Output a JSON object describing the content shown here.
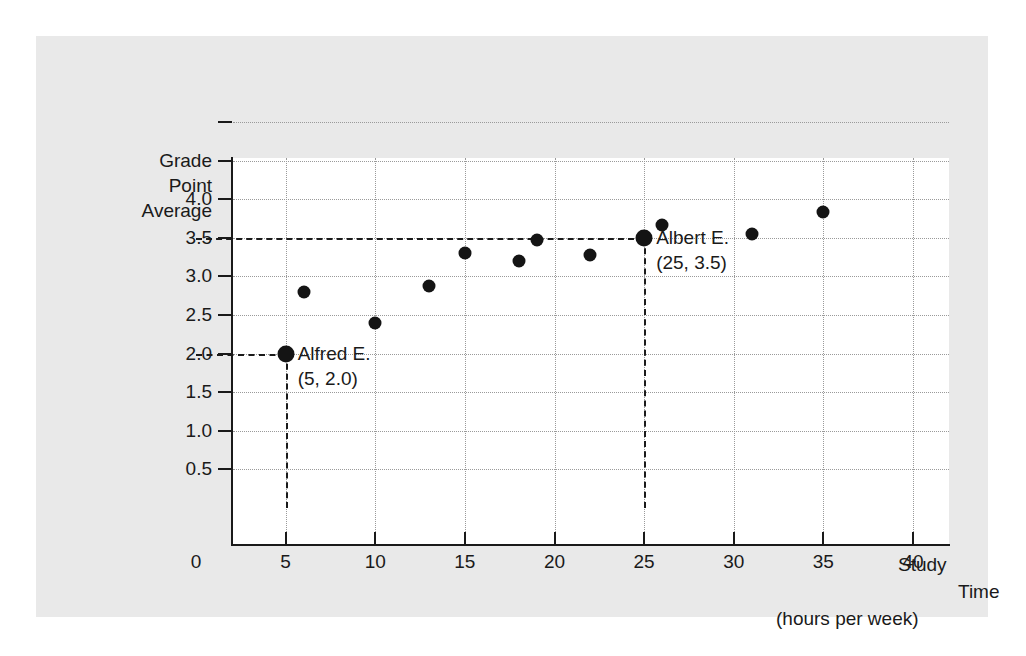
{
  "chart_data": {
    "type": "scatter",
    "title": "",
    "xlabel": "Study Time (hours per week)",
    "ylabel": "Grade Point Average",
    "ylabel_lines": [
      "Grade",
      "Point",
      "Average"
    ],
    "xlabel_lines": [
      "Study",
      "Time",
      "(hours per week)"
    ],
    "xlim": [
      0,
      40
    ],
    "ylim": [
      0,
      5.0
    ],
    "xticks": [
      0,
      5,
      10,
      15,
      20,
      25,
      30,
      35,
      40
    ],
    "xtick_labels": [
      "0",
      "5",
      "10",
      "15",
      "20",
      "25",
      "30",
      "35",
      "40"
    ],
    "yticks": [
      0.5,
      1.0,
      1.5,
      2.0,
      2.5,
      3.0,
      3.5,
      4.0,
      4.5,
      5.0
    ],
    "ytick_labels": [
      "0.5",
      "1.0",
      "1.5",
      "2.0",
      "2.5",
      "3.0",
      "3.5",
      "4.0",
      "",
      ""
    ],
    "grid": true,
    "grid_style": "dotted",
    "legend": "none",
    "points": [
      {
        "x": 5,
        "y": 2.0,
        "highlight": true
      },
      {
        "x": 6,
        "y": 2.8,
        "highlight": false
      },
      {
        "x": 10,
        "y": 2.4,
        "highlight": false
      },
      {
        "x": 13,
        "y": 2.88,
        "highlight": false
      },
      {
        "x": 15,
        "y": 3.3,
        "highlight": false
      },
      {
        "x": 18,
        "y": 3.2,
        "highlight": false
      },
      {
        "x": 19,
        "y": 3.47,
        "highlight": false
      },
      {
        "x": 22,
        "y": 3.28,
        "highlight": false
      },
      {
        "x": 25,
        "y": 3.5,
        "highlight": true
      },
      {
        "x": 26,
        "y": 3.66,
        "highlight": false
      },
      {
        "x": 31,
        "y": 3.55,
        "highlight": false
      },
      {
        "x": 35,
        "y": 3.83,
        "highlight": false
      }
    ],
    "annotations": [
      {
        "name": "Alfred E.",
        "coords": "(5, 2.0)",
        "point_x": 5,
        "point_y": 2.0
      },
      {
        "name": "Albert E.",
        "coords": "(25, 3.5)",
        "point_x": 25,
        "point_y": 3.5
      }
    ],
    "reference_lines": [
      {
        "orientation": "horizontal",
        "value": 2.0,
        "from_x": 0,
        "to_x": 5
      },
      {
        "orientation": "vertical",
        "value": 5,
        "from_y": 0,
        "to_y": 2.0
      },
      {
        "orientation": "horizontal",
        "value": 3.5,
        "from_x": 0,
        "to_x": 25
      },
      {
        "orientation": "vertical",
        "value": 25,
        "from_y": 0,
        "to_y": 3.5
      }
    ],
    "colors": {
      "panel": "#e9e9e9",
      "canvas": "#ffffff",
      "axis": "#1a1a1a",
      "marker": "#141414",
      "grid": "#9a9a9a"
    }
  }
}
